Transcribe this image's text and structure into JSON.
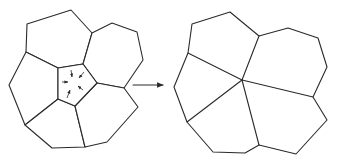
{
  "diagram": {
    "colors": {
      "stroke": "#2a2a2a",
      "background": "#ffffff"
    },
    "before": {
      "label": "",
      "cells": [
        {
          "name": "top-cell",
          "points": [
            [
              27,
              24
            ],
            [
              71,
              10
            ],
            [
              92,
              33
            ],
            [
              83,
              64
            ],
            [
              58,
              68
            ],
            [
              26,
              52
            ]
          ]
        },
        {
          "name": "top-right-cell",
          "points": [
            [
              92,
              33
            ],
            [
              112,
              23
            ],
            [
              137,
              32
            ],
            [
              143,
              60
            ],
            [
              124,
              88
            ],
            [
              97,
              83
            ],
            [
              83,
              64
            ]
          ]
        },
        {
          "name": "left-cell",
          "points": [
            [
              26,
              52
            ],
            [
              9,
              85
            ],
            [
              25,
              125
            ],
            [
              58,
              99
            ],
            [
              58,
              68
            ]
          ]
        },
        {
          "name": "bottom-left-cell",
          "points": [
            [
              25,
              125
            ],
            [
              52,
              148
            ],
            [
              85,
              147
            ],
            [
              75,
              106
            ],
            [
              58,
              99
            ]
          ]
        },
        {
          "name": "bottom-right-cell",
          "points": [
            [
              75,
              106
            ],
            [
              97,
              83
            ],
            [
              124,
              88
            ],
            [
              138,
              107
            ],
            [
              107,
              142
            ],
            [
              85,
              147
            ]
          ]
        },
        {
          "name": "central-pentagon-cell",
          "points": [
            [
              58,
              68
            ],
            [
              83,
              64
            ],
            [
              97,
              83
            ],
            [
              75,
              106
            ],
            [
              58,
              99
            ]
          ]
        }
      ],
      "shrink_arrows": [
        {
          "from": [
            71,
            70
          ],
          "to": [
            72,
            77
          ]
        },
        {
          "from": [
            84,
            72
          ],
          "to": [
            79,
            78
          ]
        },
        {
          "from": [
            62,
            82
          ],
          "to": [
            68,
            82
          ]
        },
        {
          "from": [
            83,
            90
          ],
          "to": [
            78,
            86
          ]
        },
        {
          "from": [
            67,
            98
          ],
          "to": [
            70,
            90
          ]
        }
      ]
    },
    "transition_arrow": {
      "from": [
        133,
        85
      ],
      "to": [
        163,
        85
      ]
    },
    "after": {
      "label": "",
      "center": [
        242,
        80
      ],
      "outline": [
        [
          192,
          24
        ],
        [
          230,
          12
        ],
        [
          259,
          36
        ],
        [
          288,
          28
        ],
        [
          318,
          38
        ],
        [
          327,
          67
        ],
        [
          313,
          97
        ],
        [
          327,
          120
        ],
        [
          296,
          154
        ],
        [
          259,
          145
        ],
        [
          245,
          153
        ],
        [
          213,
          152
        ],
        [
          187,
          122
        ],
        [
          174,
          87
        ],
        [
          188,
          53
        ]
      ],
      "spokes": [
        [
          259,
          36
        ],
        [
          313,
          97
        ],
        [
          259,
          145
        ],
        [
          187,
          122
        ],
        [
          188,
          53
        ]
      ]
    }
  }
}
